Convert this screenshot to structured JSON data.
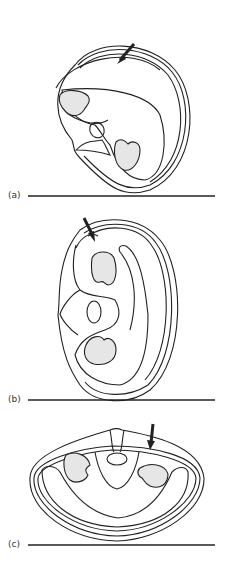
{
  "panels": [
    {
      "label": "(a)",
      "description": "Cross-section tilted, arrow at upper right wall"
    },
    {
      "label": "(b)",
      "description": "Cross-section upright on side, arrow at top left"
    },
    {
      "label": "(c)",
      "description": "Cross-section lying flat, arrow at top right"
    }
  ],
  "colors": {
    "stroke": "#222222",
    "fill_shaded": "#e6e6e6",
    "baseline": "#222222"
  }
}
